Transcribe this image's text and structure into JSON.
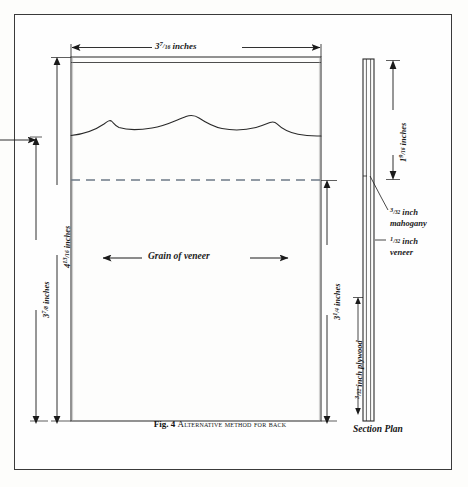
{
  "figure": {
    "caption_number": "Fig. 4",
    "caption_text": "Alternative method for back",
    "section_caption": "Section Plan"
  },
  "front_view": {
    "width_label": {
      "whole": "3",
      "numerator": "7",
      "denominator": "16",
      "unit": "inches"
    },
    "overall_height_label": {
      "whole": "4",
      "numerator": "13",
      "denominator": "16",
      "unit": "inches"
    },
    "left_height_label": {
      "whole": "3",
      "numerator": "7",
      "denominator": "8",
      "unit": "inches"
    },
    "right_height_label": {
      "whole": "3",
      "numerator": "1",
      "denominator": "4",
      "unit": "inches"
    },
    "grain_label": "Grain of veneer"
  },
  "section_plan": {
    "top_dim_label": {
      "whole": "1",
      "numerator": "9",
      "denominator": "16",
      "unit": "inches"
    },
    "mahogany_label": {
      "whole": "",
      "numerator": "3",
      "denominator": "32",
      "unit": "inch",
      "material": "mahogany"
    },
    "veneer_label": {
      "whole": "",
      "numerator": "1",
      "denominator": "32",
      "unit": "inch",
      "material": "veneer"
    },
    "plywood_label": {
      "whole": "",
      "numerator": "3",
      "denominator": "32",
      "unit": "inch",
      "material": "plywood"
    }
  },
  "colors": {
    "ink": "#1a1a1a",
    "rule": "#3a3a3a",
    "dashed": "#6e7a86",
    "panel_fill": "#fdfdfc",
    "page_bg": "#ffffff"
  }
}
